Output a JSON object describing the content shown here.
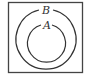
{
  "diagram": {
    "type": "venn",
    "universe": {
      "label": ""
    },
    "sets": [
      {
        "name": "B",
        "label": "B",
        "contains": [
          "A"
        ]
      },
      {
        "name": "A",
        "label": "A",
        "subset_of": "B"
      }
    ],
    "relation": "A ⊂ B",
    "colors": {
      "stroke": "#333333",
      "background": "#ffffff"
    }
  }
}
